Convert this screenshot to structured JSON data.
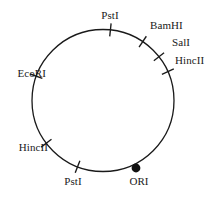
{
  "figure": {
    "type": "plasmid-restriction-map",
    "background_color": "#ffffff",
    "stroke_color": "#1a1a1a",
    "circle": {
      "center_x": 103,
      "center_y": 100.5,
      "radius": 71,
      "stroke_width": 1.3
    }
  },
  "origin": {
    "label": "ORI",
    "marker": "filled-circle",
    "marker_x": 136,
    "marker_y": 168,
    "marker_radius": 4.4,
    "label_x": 139,
    "label_y": 181
  },
  "sites": [
    {
      "id": "pstI-top",
      "label": "PstI",
      "angle_deg": 84,
      "tick_x": 110.5,
      "tick_y": 30,
      "label_x": 110,
      "label_y": 15,
      "align": "center"
    },
    {
      "id": "bamHI",
      "label": "BamHI",
      "angle_deg": 56,
      "tick_x": 142,
      "tick_y": 42,
      "label_x": 150,
      "label_y": 25,
      "align": "left"
    },
    {
      "id": "salI",
      "label": "SalI",
      "angle_deg": 38,
      "tick_x": 159,
      "tick_y": 57,
      "label_x": 172,
      "label_y": 42,
      "align": "left"
    },
    {
      "id": "hincII-right",
      "label": "HincII",
      "angle_deg": 24,
      "tick_x": 168,
      "tick_y": 72,
      "label_x": 175,
      "label_y": 60,
      "align": "left"
    },
    {
      "id": "ecoRI",
      "label": "EcoRI",
      "angle_deg": 160,
      "tick_x": 36.3,
      "tick_y": 76,
      "label_x": 46,
      "label_y": 73,
      "align": "right"
    },
    {
      "id": "hincII-left",
      "label": "HincII",
      "angle_deg": 217,
      "tick_x": 46.3,
      "tick_y": 143,
      "label_x": 48,
      "label_y": 147,
      "align": "right"
    },
    {
      "id": "pstI-bottom",
      "label": "PstI",
      "angle_deg": 249,
      "tick_x": 77.6,
      "tick_y": 166,
      "label_x": 73,
      "label_y": 181,
      "align": "center"
    }
  ],
  "chart_data": {
    "type": "diagram",
    "title": "",
    "features": [
      {
        "name": "PstI",
        "position_deg": 84
      },
      {
        "name": "BamHI",
        "position_deg": 56
      },
      {
        "name": "SalI",
        "position_deg": 38
      },
      {
        "name": "HincII",
        "position_deg": 24
      },
      {
        "name": "ORI",
        "position_deg": 296
      },
      {
        "name": "PstI",
        "position_deg": 249
      },
      {
        "name": "HincII",
        "position_deg": 217
      },
      {
        "name": "EcoRI",
        "position_deg": 160
      }
    ]
  }
}
